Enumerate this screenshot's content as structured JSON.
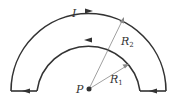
{
  "diagram": {
    "type": "semicircular current loop",
    "labels": {
      "current": "I",
      "outer_radius": "R",
      "outer_radius_sub": "2",
      "inner_radius": "R",
      "inner_radius_sub": "1",
      "point": "P"
    },
    "colors": {
      "wire": "#333333",
      "radius_line": "#777777",
      "point": "#333333"
    }
  }
}
